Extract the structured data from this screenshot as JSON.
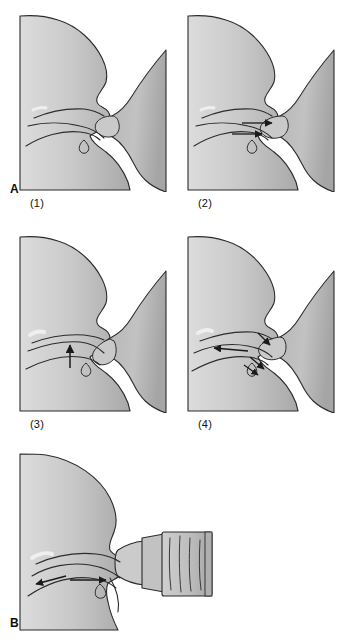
{
  "figure": {
    "type": "anatomical-illustration",
    "background_color": "#ffffff",
    "ink_color": "#1a1a1a",
    "tissue_fill_light": "#d2d2d2",
    "tissue_fill_mid": "#bfbfbf",
    "tissue_fill_dark": "#a8a8a8",
    "breast_fill": "#b8b8b8",
    "bottle_fill": "#c4c4c4",
    "scan_artifact_text": " "
  },
  "groups": [
    {
      "id": "A",
      "label": "A",
      "label_x": 10,
      "label_y": 183,
      "caption": "Breastfeeding: four stages of the suck cycle"
    },
    {
      "id": "B",
      "label": "B",
      "label_x": 10,
      "label_y": 617,
      "caption": "Bottle feeding with an artificial teat"
    }
  ],
  "panels": [
    {
      "id": "a1",
      "group": "A",
      "label": "(1)",
      "label_x": 30,
      "label_y": 203,
      "x": 18,
      "y": 12,
      "w": 150,
      "h": 180,
      "description": "Infant head in sagittal section with breast nipple drawn into mouth; tongue and hard palate outlined. No motion arrows.",
      "arrows": []
    },
    {
      "id": "a2",
      "group": "A",
      "label": "(2)",
      "label_x": 198,
      "label_y": 203,
      "x": 186,
      "y": 12,
      "w": 150,
      "h": 180,
      "description": "Nipple teat elongated; two arrows point posteriorly as the tongue draws the teat back.",
      "arrows": [
        {
          "direction": "right",
          "meaning": "teat drawn posteriorly"
        },
        {
          "direction": "right",
          "meaning": "tongue moves back"
        }
      ]
    },
    {
      "id": "a3",
      "group": "A",
      "label": "(3)",
      "label_x": 30,
      "label_y": 424,
      "x": 18,
      "y": 233,
      "w": 150,
      "h": 180,
      "description": "Tongue rises against hard palate compressing the teat; a single arrow points upward.",
      "arrows": [
        {
          "direction": "up",
          "meaning": "tongue elevates against palate"
        }
      ]
    },
    {
      "id": "a4",
      "group": "A",
      "label": "(4)",
      "label_x": 198,
      "label_y": 424,
      "x": 186,
      "y": 233,
      "w": 150,
      "h": 180,
      "description": "Peristaltic wave: milk stripped backward while the teat recoils; arrows point anteriorly and posteriorly.",
      "arrows": [
        {
          "direction": "left",
          "meaning": "teat recoil forward"
        },
        {
          "direction": "right-down",
          "meaning": "milk propelled to pharynx"
        },
        {
          "direction": "right-down",
          "meaning": "peristaltic stripping wave"
        }
      ]
    },
    {
      "id": "b1",
      "group": "B",
      "label": "",
      "label_x": 0,
      "label_y": 0,
      "x": 14,
      "y": 452,
      "w": 218,
      "h": 180,
      "description": "Infant with rigid bottle teat; shallow latch with the tongue thrust forward. Arrows show anterior and posterior tongue motion against the artificial teat.",
      "arrows": [
        {
          "direction": "left",
          "meaning": "tongue thrusts forward to control flow"
        },
        {
          "direction": "right",
          "meaning": "tongue pushes back against teat"
        }
      ]
    }
  ]
}
